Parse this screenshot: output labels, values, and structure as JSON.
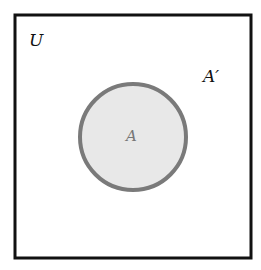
{
  "diagram": {
    "type": "venn",
    "universe": {
      "label": "U",
      "border_color": "#111111",
      "fill": "#ffffff"
    },
    "set": {
      "label": "A",
      "fill": "#e8e8e8",
      "stroke": "#7a7a7a",
      "label_color": "#777777"
    },
    "complement": {
      "label": "A′",
      "label_color": "#111111"
    }
  }
}
